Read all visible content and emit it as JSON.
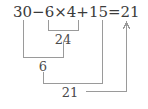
{
  "figure": {
    "type": "order-of-operations-worked-example",
    "expression_text": "30−6×4+15=21",
    "tokens": [
      {
        "id": "t-30",
        "text": "30",
        "x": 13,
        "y": 4
      },
      {
        "id": "t-minus",
        "text": "−",
        "x": 32,
        "y": 4
      },
      {
        "id": "t-6",
        "text": "6",
        "x": 45,
        "y": 4
      },
      {
        "id": "t-times",
        "text": "×",
        "x": 54,
        "y": 4
      },
      {
        "id": "t-4",
        "text": "4",
        "x": 67,
        "y": 4
      },
      {
        "id": "t-plus",
        "text": "+",
        "x": 76,
        "y": 4
      },
      {
        "id": "t-15",
        "text": "15",
        "x": 88,
        "y": 4
      },
      {
        "id": "t-equals",
        "text": "=",
        "x": 106,
        "y": 4
      },
      {
        "id": "t-21",
        "text": "21",
        "x": 119,
        "y": 4
      }
    ],
    "steps": [
      {
        "id": "step-1",
        "name": "multiply-6-times-4",
        "result": "24",
        "label_x": 63,
        "label_y": 33,
        "bracket": {
          "left": 48,
          "right": 78,
          "top": 20,
          "bottom": 30
        }
      },
      {
        "id": "step-2",
        "name": "subtract-30-minus-24",
        "result": "6",
        "label_x": 43,
        "label_y": 60,
        "bracket": {
          "left": 23,
          "right": 63,
          "top": 20,
          "bottom": 57
        }
      },
      {
        "id": "step-3",
        "name": "add-6-plus-15",
        "result": "21",
        "label_x": 70,
        "label_y": 91,
        "bracket": {
          "left": 43,
          "right": 102,
          "top": 20,
          "bottom": 83
        }
      }
    ],
    "answer_arrow": {
      "name": "answer-arrow-to-21",
      "from_x": 86,
      "from_y": 91,
      "to_x": 126,
      "to_y": 91,
      "up_to_y": 23,
      "points_at": "21"
    },
    "colors": {
      "text": "#3b3b3b",
      "label": "#4a4a4a",
      "rule": "#9a9a9a",
      "background": "#ffffff"
    }
  }
}
